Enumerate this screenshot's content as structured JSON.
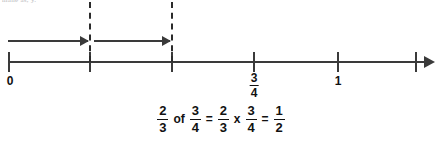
{
  "artifact": {
    "top_text": "mane as, y."
  },
  "number_line": {
    "start_value": "0",
    "end_value": "5/4",
    "axis_color": "#3a3a3a",
    "arrow_direction": "right",
    "ticks": [
      {
        "x": 8,
        "value": "0",
        "label": "0",
        "label_type": "plain",
        "numerator": "",
        "denominator": ""
      },
      {
        "x": 89,
        "value": "1/4",
        "label": "",
        "label_type": "none",
        "numerator": "",
        "denominator": ""
      },
      {
        "x": 171,
        "value": "2/4",
        "label": "",
        "label_type": "none",
        "numerator": "",
        "denominator": ""
      },
      {
        "x": 253,
        "value": "3/4",
        "label": "3/4",
        "label_type": "fraction",
        "numerator": "3",
        "denominator": "4"
      },
      {
        "x": 337,
        "value": "1",
        "label": "1",
        "label_type": "plain",
        "numerator": "",
        "denominator": ""
      },
      {
        "x": 415,
        "value": "5/4",
        "label": "",
        "label_type": "none",
        "numerator": "",
        "denominator": ""
      }
    ],
    "dashed_guides": [
      {
        "x": 89,
        "name": "dashed-guide-quarter"
      },
      {
        "x": 171,
        "name": "dashed-guide-half"
      }
    ],
    "hops": [
      {
        "from_x": 8,
        "to_x": 88,
        "label": "hop-one"
      },
      {
        "from_x": 94,
        "to_x": 170,
        "label": "hop-two"
      }
    ]
  },
  "equation": {
    "full_text": "2/3 of 3/4 = 2/3 x 3/4 = 1/2",
    "terms": [
      {
        "kind": "fraction",
        "numerator": "2",
        "denominator": "3"
      },
      {
        "kind": "operator",
        "text": "of"
      },
      {
        "kind": "fraction",
        "numerator": "3",
        "denominator": "4"
      },
      {
        "kind": "operator",
        "text": "="
      },
      {
        "kind": "fraction",
        "numerator": "2",
        "denominator": "3"
      },
      {
        "kind": "operator",
        "text": "x"
      },
      {
        "kind": "fraction",
        "numerator": "3",
        "denominator": "4"
      },
      {
        "kind": "operator",
        "text": "="
      },
      {
        "kind": "fraction",
        "numerator": "1",
        "denominator": "2"
      }
    ]
  }
}
